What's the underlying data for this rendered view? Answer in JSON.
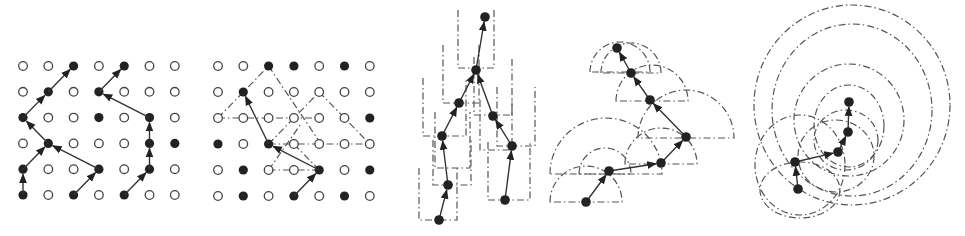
{
  "figure": {
    "colors": {
      "node_filled": "#222222",
      "node_empty": "#ffffff",
      "edge": "#333333",
      "dashed_region": "#555555"
    }
  },
  "panels": [
    {
      "id": "panel-1",
      "type": "grid-paths",
      "grid": {
        "origin": [
          23,
          66
        ],
        "dx": 25.3,
        "dy": 25.8,
        "cols": 7,
        "rows": 6,
        "filled": [
          [
            0,
            0,
            1,
            0,
            1,
            0,
            0
          ],
          [
            0,
            1,
            0,
            1,
            0,
            0,
            0
          ],
          [
            1,
            0,
            0,
            1,
            0,
            1,
            0
          ],
          [
            0,
            1,
            0,
            0,
            0,
            1,
            1
          ],
          [
            1,
            0,
            0,
            1,
            0,
            1,
            0
          ],
          [
            1,
            0,
            1,
            0,
            1,
            0,
            0
          ]
        ]
      },
      "paths": [
        [
          [
            0,
            5
          ],
          [
            0,
            4
          ],
          [
            1,
            3
          ],
          [
            0,
            2
          ],
          [
            1,
            1
          ],
          [
            2,
            0
          ]
        ],
        [
          [
            3,
            4
          ],
          [
            1,
            3
          ]
        ],
        [
          [
            2,
            5
          ],
          [
            3,
            4
          ]
        ],
        [
          [
            4,
            5
          ],
          [
            5,
            4
          ],
          [
            5,
            3
          ],
          [
            5,
            2
          ],
          [
            3,
            1
          ],
          [
            4,
            0
          ]
        ]
      ],
      "dashed": []
    },
    {
      "id": "panel-2",
      "type": "grid-paths",
      "grid": {
        "origin": [
          218,
          66
        ],
        "dx": 25.3,
        "dy": 26,
        "cols": 7,
        "rows": 6,
        "filled": [
          [
            0,
            0,
            1,
            1,
            0,
            1,
            0
          ],
          [
            0,
            1,
            0,
            0,
            0,
            0,
            0
          ],
          [
            0,
            0,
            0,
            0,
            0,
            0,
            1
          ],
          [
            1,
            0,
            1,
            0,
            0,
            0,
            0
          ],
          [
            0,
            1,
            0,
            0,
            1,
            0,
            1
          ],
          [
            0,
            1,
            0,
            1,
            0,
            1,
            0
          ]
        ]
      },
      "paths": [
        [
          [
            3,
            5
          ],
          [
            4,
            4
          ],
          [
            2,
            3
          ],
          [
            1,
            1
          ]
        ]
      ],
      "dashed": [
        [
          [
            0,
            2
          ],
          [
            2,
            0
          ],
          [
            4,
            2.9
          ]
        ],
        [
          [
            0,
            2
          ],
          [
            4,
            2
          ]
        ],
        [
          [
            2,
            3
          ],
          [
            4,
            1
          ],
          [
            6,
            3
          ]
        ],
        [
          [
            2,
            3
          ],
          [
            6,
            3
          ]
        ],
        [
          [
            2,
            4
          ],
          [
            4,
            4
          ]
        ],
        [
          [
            2,
            4
          ],
          [
            3.3,
            2.2
          ]
        ],
        [
          [
            4,
            4
          ],
          [
            3,
            3
          ]
        ]
      ]
    },
    {
      "id": "panel-3",
      "type": "tree-boxes",
      "nodes": [
        [
          485,
          17
        ],
        [
          476,
          70
        ],
        [
          459,
          103
        ],
        [
          442,
          136
        ],
        [
          448,
          185
        ],
        [
          439,
          220
        ],
        [
          493,
          116
        ],
        [
          512,
          146
        ],
        [
          505,
          200
        ]
      ],
      "edges": [
        [
          5,
          4
        ],
        [
          4,
          3
        ],
        [
          3,
          2
        ],
        [
          2,
          1
        ],
        [
          1,
          0
        ],
        [
          8,
          7
        ],
        [
          7,
          6
        ],
        [
          6,
          1
        ]
      ],
      "boxes": [
        [
          458,
          10,
          494,
          68
        ],
        [
          443,
          45,
          479,
          103
        ],
        [
          474,
          57,
          512,
          115
        ],
        [
          423,
          78,
          466,
          136
        ],
        [
          435,
          112,
          470,
          168
        ],
        [
          480,
          100,
          512,
          150
        ],
        [
          497,
          87,
          535,
          146
        ],
        [
          433,
          140,
          471,
          185
        ],
        [
          419,
          168,
          457,
          220
        ],
        [
          488,
          142,
          530,
          200
        ]
      ]
    },
    {
      "id": "panel-4",
      "type": "tree-semicircles",
      "nodes": [
        [
          586,
          202
        ],
        [
          609,
          171
        ],
        [
          661,
          163
        ],
        [
          686,
          137
        ],
        [
          650,
          100
        ],
        [
          631,
          73
        ],
        [
          617,
          48
        ]
      ],
      "edges": [
        [
          0,
          1
        ],
        [
          1,
          2
        ],
        [
          2,
          3
        ],
        [
          3,
          4
        ],
        [
          4,
          5
        ],
        [
          5,
          6
        ]
      ],
      "semicircles": [
        [
          586,
          202,
          36
        ],
        [
          605,
          174,
          26
        ],
        [
          606,
          174,
          56
        ],
        [
          661,
          164,
          36
        ],
        [
          686,
          138,
          48
        ],
        [
          652,
          101,
          36
        ],
        [
          631,
          73,
          30
        ],
        [
          620,
          72,
          30
        ]
      ]
    },
    {
      "id": "panel-5",
      "type": "tree-circles",
      "nodes": [
        [
          798,
          189
        ],
        [
          795,
          162
        ],
        [
          838,
          152
        ],
        [
          848,
          132
        ],
        [
          849,
          102
        ]
      ],
      "edges": [
        [
          0,
          1
        ],
        [
          1,
          2
        ],
        [
          2,
          3
        ],
        [
          3,
          4
        ]
      ],
      "ellipses": [
        [
          852,
          105,
          98,
          100
        ],
        [
          852,
          110,
          80,
          86
        ],
        [
          849,
          120,
          55,
          56
        ],
        [
          849,
          126,
          35,
          41
        ],
        [
          846,
          140,
          32,
          30
        ],
        [
          836,
          156,
          38,
          36
        ],
        [
          800,
          165,
          45,
          50
        ],
        [
          800,
          190,
          40,
          28
        ]
      ]
    }
  ]
}
